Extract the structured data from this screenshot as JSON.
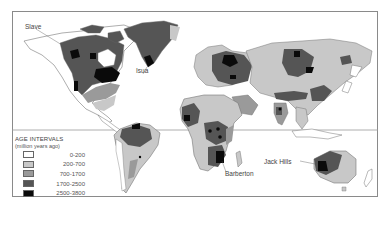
{
  "map": {
    "title": "World map of crustal age intervals",
    "site_labels": [
      {
        "name": "Slave",
        "x": 25,
        "y": 22
      },
      {
        "name": "Isua",
        "x": 136,
        "y": 67
      },
      {
        "name": "Barberton",
        "x": 225,
        "y": 170
      },
      {
        "name": "Jack Hills",
        "x": 263,
        "y": 158
      }
    ]
  },
  "legend": {
    "title": "AGE INTERVALS",
    "subtitle": "(million years ago)",
    "items": [
      {
        "label": "0-200",
        "color": "#ffffff"
      },
      {
        "label": "200-700",
        "color": "#c8c8c8"
      },
      {
        "label": "700-1700",
        "color": "#9a9a9a"
      },
      {
        "label": "1700-2500",
        "color": "#555555"
      },
      {
        "label": "2500-3800",
        "color": "#0a0a0a"
      }
    ]
  },
  "colors": {
    "frame": "#8a8a8a",
    "equator": "#9a9a9a",
    "outline": "#777777"
  }
}
